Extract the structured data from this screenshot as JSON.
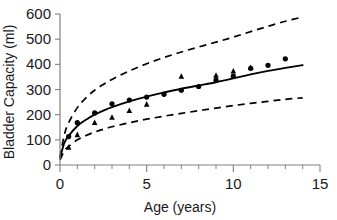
{
  "chart_data": {
    "type": "scatter",
    "title": "",
    "xlabel": "Age (years)",
    "ylabel": "Bladder Capacity (ml)",
    "xlim": [
      0,
      15
    ],
    "ylim": [
      0,
      600
    ],
    "xticks": [
      0,
      5,
      10,
      15
    ],
    "xtick_labels": [
      "0",
      "5",
      "10",
      "15"
    ],
    "xticks_minor": [
      1,
      2,
      3,
      4,
      6,
      7,
      8,
      9,
      11,
      12,
      13,
      14
    ],
    "yticks": [
      0,
      100,
      200,
      300,
      400,
      500,
      600
    ],
    "ytick_labels": [
      "0",
      "100",
      "200",
      "300",
      "400",
      "500",
      "600"
    ],
    "grid": false,
    "legend": "none",
    "series": [
      {
        "name": "upper-marker-series",
        "marker": "circle",
        "color": "#000000",
        "points": [
          {
            "x": 0.5,
            "y": 113
          },
          {
            "x": 1.0,
            "y": 168
          },
          {
            "x": 2.0,
            "y": 207
          },
          {
            "x": 3.0,
            "y": 243
          },
          {
            "x": 4.0,
            "y": 258
          },
          {
            "x": 5.0,
            "y": 270
          },
          {
            "x": 6.0,
            "y": 281
          },
          {
            "x": 7.0,
            "y": 297
          },
          {
            "x": 8.0,
            "y": 312
          },
          {
            "x": 9.0,
            "y": 337
          },
          {
            "x": 10.0,
            "y": 353
          },
          {
            "x": 11.0,
            "y": 384
          },
          {
            "x": 12.0,
            "y": 396
          },
          {
            "x": 13.0,
            "y": 422
          }
        ]
      },
      {
        "name": "lower-marker-series",
        "marker": "triangle",
        "color": "#000000",
        "points": [
          {
            "x": 0.5,
            "y": 70
          },
          {
            "x": 1.0,
            "y": 120
          },
          {
            "x": 2.0,
            "y": 168
          },
          {
            "x": 3.0,
            "y": 189
          },
          {
            "x": 4.0,
            "y": 216
          },
          {
            "x": 5.0,
            "y": 241
          },
          {
            "x": 7.0,
            "y": 352
          },
          {
            "x": 9.0,
            "y": 356
          },
          {
            "x": 10.0,
            "y": 373
          },
          {
            "x": 11.0,
            "y": 387
          }
        ]
      }
    ],
    "curves": [
      {
        "name": "fitted-curve",
        "style": "solid",
        "color": "#000000",
        "points": [
          {
            "x": 0.0,
            "y": 28
          },
          {
            "x": 0.25,
            "y": 88
          },
          {
            "x": 0.5,
            "y": 116
          },
          {
            "x": 1.0,
            "y": 155
          },
          {
            "x": 1.5,
            "y": 180
          },
          {
            "x": 2.0,
            "y": 200
          },
          {
            "x": 2.5,
            "y": 216
          },
          {
            "x": 3.0,
            "y": 230
          },
          {
            "x": 4.0,
            "y": 253
          },
          {
            "x": 5.0,
            "y": 272
          },
          {
            "x": 6.0,
            "y": 288
          },
          {
            "x": 7.0,
            "y": 303
          },
          {
            "x": 8.0,
            "y": 316
          },
          {
            "x": 9.0,
            "y": 329
          },
          {
            "x": 10.0,
            "y": 344
          },
          {
            "x": 11.0,
            "y": 360
          },
          {
            "x": 12.0,
            "y": 374
          },
          {
            "x": 13.0,
            "y": 386
          },
          {
            "x": 14.0,
            "y": 397
          }
        ]
      },
      {
        "name": "upper-bound-curve",
        "style": "dashed",
        "color": "#000000",
        "points": [
          {
            "x": 0.0,
            "y": 30
          },
          {
            "x": 0.25,
            "y": 120
          },
          {
            "x": 0.5,
            "y": 168
          },
          {
            "x": 1.0,
            "y": 228
          },
          {
            "x": 1.5,
            "y": 267
          },
          {
            "x": 2.0,
            "y": 297
          },
          {
            "x": 2.5,
            "y": 320
          },
          {
            "x": 3.0,
            "y": 340
          },
          {
            "x": 4.0,
            "y": 374
          },
          {
            "x": 5.0,
            "y": 402
          },
          {
            "x": 6.0,
            "y": 427
          },
          {
            "x": 7.0,
            "y": 449
          },
          {
            "x": 8.0,
            "y": 469
          },
          {
            "x": 9.0,
            "y": 488
          },
          {
            "x": 10.0,
            "y": 508
          },
          {
            "x": 11.0,
            "y": 530
          },
          {
            "x": 12.0,
            "y": 551
          },
          {
            "x": 13.0,
            "y": 571
          },
          {
            "x": 14.0,
            "y": 588
          }
        ]
      },
      {
        "name": "lower-bound-curve",
        "style": "dashed",
        "color": "#000000",
        "points": [
          {
            "x": 0.0,
            "y": 20
          },
          {
            "x": 0.25,
            "y": 56
          },
          {
            "x": 0.5,
            "y": 74
          },
          {
            "x": 1.0,
            "y": 100
          },
          {
            "x": 1.5,
            "y": 117
          },
          {
            "x": 2.0,
            "y": 131
          },
          {
            "x": 2.5,
            "y": 142
          },
          {
            "x": 3.0,
            "y": 152
          },
          {
            "x": 4.0,
            "y": 168
          },
          {
            "x": 5.0,
            "y": 182
          },
          {
            "x": 6.0,
            "y": 194
          },
          {
            "x": 7.0,
            "y": 205
          },
          {
            "x": 8.0,
            "y": 216
          },
          {
            "x": 9.0,
            "y": 226
          },
          {
            "x": 10.0,
            "y": 236
          },
          {
            "x": 11.0,
            "y": 245
          },
          {
            "x": 12.0,
            "y": 253
          },
          {
            "x": 13.0,
            "y": 261
          },
          {
            "x": 14.0,
            "y": 267
          }
        ]
      }
    ]
  }
}
